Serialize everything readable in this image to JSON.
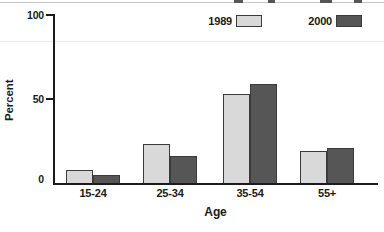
{
  "figure": {
    "colors": {
      "series_1989_fill": "#d9d9d9",
      "series_2000_fill": "#565656",
      "bar_border": "#3b3b3b",
      "axis": "#1b1b1b"
    }
  },
  "chart_data": {
    "type": "bar",
    "categories": [
      "15-24",
      "25-34",
      "35-54",
      "55+"
    ],
    "series": [
      {
        "name": "1989",
        "values": [
          8,
          23,
          53,
          19
        ]
      },
      {
        "name": "2000",
        "values": [
          5,
          16,
          59,
          21
        ]
      }
    ],
    "title": "",
    "xlabel": "Age",
    "ylabel": "Percent",
    "ylim": [
      0,
      100
    ],
    "yticks": [
      0,
      50,
      100
    ],
    "legend_position": "top",
    "grid": false
  }
}
